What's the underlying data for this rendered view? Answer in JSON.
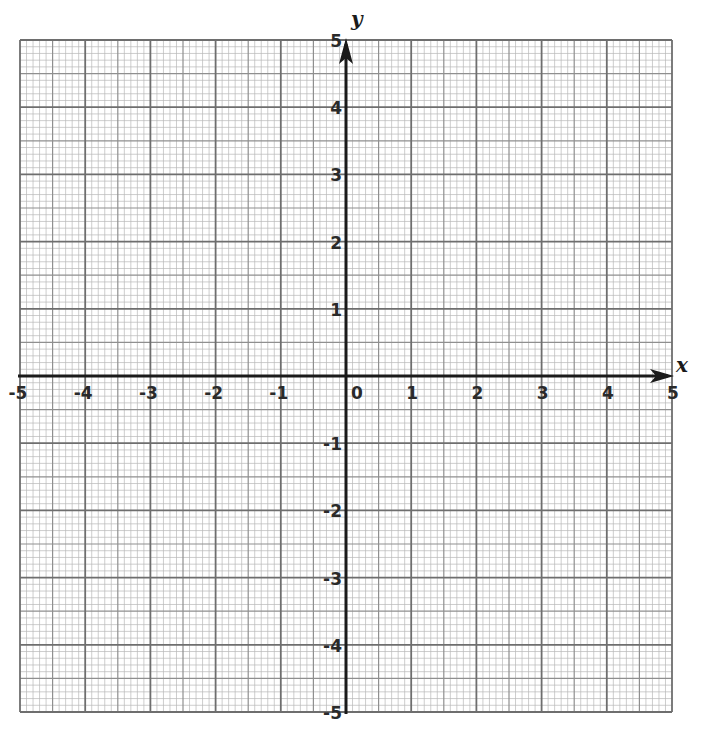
{
  "diagram": {
    "type": "coordinate-plane",
    "x_axis": {
      "label": "x",
      "min": -5,
      "max": 5,
      "ticks": [
        -5,
        -4,
        -3,
        -2,
        -1,
        0,
        1,
        2,
        3,
        4,
        5
      ]
    },
    "y_axis": {
      "label": "y",
      "min": -5,
      "max": 5,
      "ticks": [
        5,
        4,
        3,
        2,
        1,
        -1,
        -2,
        -3,
        -4,
        -5
      ]
    },
    "grid": {
      "minor_per_unit": 10,
      "medium_per_unit": 2,
      "major_per_unit": 1
    },
    "colors": {
      "minor_line": "#b8b8b8",
      "medium_line": "#8f8f8f",
      "major_line": "#6e6e6e",
      "axis": "#1a1a1a"
    }
  },
  "labels": {
    "x_name": "x",
    "y_name": "y",
    "x_ticks": [
      "-5",
      "-4",
      "-3",
      "-2",
      "-1",
      "0",
      "1",
      "2",
      "3",
      "4",
      "5"
    ],
    "y_ticks_pos": [
      "1",
      "2",
      "3",
      "4",
      "5"
    ],
    "y_ticks_neg": [
      "-1",
      "-2",
      "-3",
      "-4",
      "-5"
    ]
  }
}
